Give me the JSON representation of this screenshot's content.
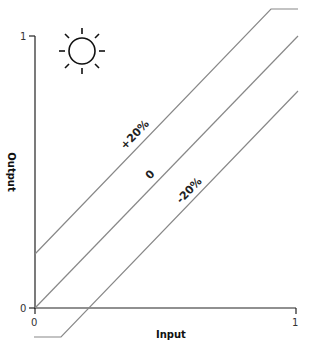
{
  "icon": "sun-icon",
  "axes": {
    "x_label": "Input",
    "y_label": "Output",
    "x_ticks": [
      "0",
      "1"
    ],
    "y_ticks": [
      "0",
      "1"
    ]
  },
  "lines": [
    {
      "label": "+20%",
      "offset": 0.2
    },
    {
      "label": "0",
      "offset": 0
    },
    {
      "label": "-20%",
      "offset": -0.2
    }
  ],
  "colors": {
    "axis": "#222222",
    "line": "#888888"
  }
}
